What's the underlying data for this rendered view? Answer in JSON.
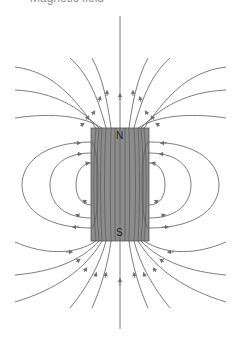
{
  "figure": {
    "title_fragment": "Magnetic field",
    "magnet": {
      "north_label": "N",
      "south_label": "S",
      "fill_color": "#8c8c8c",
      "border_color": "#555555"
    },
    "field_line_color": "#6e6e6e"
  }
}
